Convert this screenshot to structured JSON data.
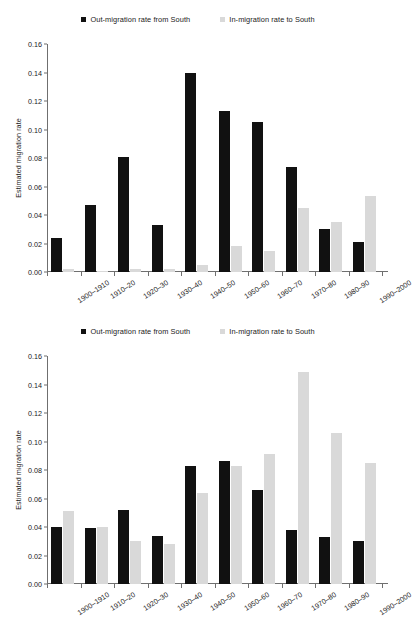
{
  "figures": [
    {
      "name": "top-chart",
      "legend": [
        {
          "label": "Out-migration rate from South",
          "color": "#111111"
        },
        {
          "label": "In-migration rate to South",
          "color": "#d9d9d9"
        }
      ],
      "chart_data": {
        "type": "bar",
        "title": "",
        "xlabel": "",
        "ylabel": "Estimated migration rate",
        "ylim": [
          0,
          0.16
        ],
        "yticks": [
          "0.00",
          "0.02",
          "0.04",
          "0.06",
          "0.08",
          "0.10",
          "0.12",
          "0.14",
          "0.16"
        ],
        "ytick_values": [
          0,
          0.02,
          0.04,
          0.06,
          0.08,
          0.1,
          0.12,
          0.14,
          0.16
        ],
        "grid": false,
        "legend_position": "top-center",
        "categories": [
          "1900–1910",
          "1910–20",
          "1920–30",
          "1930–40",
          "1940–50",
          "1950–60",
          "1960–70",
          "1970–80",
          "1980–90",
          "1990–2000"
        ],
        "series": [
          {
            "name": "Out-migration rate from South",
            "color": "#111111",
            "values": [
              0.024,
              0.047,
              0.081,
              0.033,
              0.14,
              0.113,
              0.105,
              0.074,
              0.03,
              0.021
            ]
          },
          {
            "name": "In-migration rate to South",
            "color": "#d9d9d9",
            "values": [
              0.002,
              0.001,
              0.002,
              0.002,
              0.005,
              0.018,
              0.015,
              0.045,
              0.035,
              0.053
            ]
          }
        ]
      }
    },
    {
      "name": "bottom-chart",
      "legend": [
        {
          "label": "Out-migration rate from South",
          "color": "#111111"
        },
        {
          "label": "In-migration rate to South",
          "color": "#d9d9d9"
        }
      ],
      "chart_data": {
        "type": "bar",
        "title": "",
        "xlabel": "",
        "ylabel": "Estimated migration rate",
        "ylim": [
          0,
          0.16
        ],
        "yticks": [
          "0.00",
          "0.02",
          "0.04",
          "0.06",
          "0.08",
          "0.10",
          "0.12",
          "0.14",
          "0.16"
        ],
        "ytick_values": [
          0,
          0.02,
          0.04,
          0.06,
          0.08,
          0.1,
          0.12,
          0.14,
          0.16
        ],
        "grid": false,
        "legend_position": "top-center",
        "categories": [
          "1900–1910",
          "1910–20",
          "1920–30",
          "1930–40",
          "1940–50",
          "1950–60",
          "1960–70",
          "1970–80",
          "1980–90",
          "1990–2000"
        ],
        "series": [
          {
            "name": "Out-migration rate from South",
            "color": "#111111",
            "values": [
              0.04,
              0.039,
              0.052,
              0.034,
              0.083,
              0.086,
              0.066,
              0.038,
              0.033,
              0.03
            ]
          },
          {
            "name": "In-migration rate to South",
            "color": "#d9d9d9",
            "values": [
              0.051,
              0.04,
              0.03,
              0.028,
              0.064,
              0.083,
              0.091,
              0.149,
              0.106,
              0.085
            ]
          }
        ]
      }
    }
  ]
}
